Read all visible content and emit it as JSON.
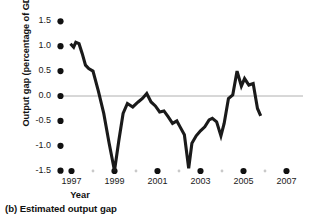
{
  "figure": {
    "caption": "(b) Estimated output gap",
    "background": "#ffffff"
  },
  "colors": {
    "line": "#1a1a1a",
    "zero_line": "#b0b0b0",
    "major_tick": "#111111",
    "minor_tick": "#c9c9c9",
    "text": "#111111"
  },
  "chart_data": {
    "type": "line",
    "title": "",
    "subtitle": "",
    "xlabel": "Year",
    "ylabel": "Output gap (percentage of GDP)",
    "xlim": [
      1996.3,
      2007.6
    ],
    "ylim": [
      -1.6,
      1.62
    ],
    "grid": false,
    "legend": false,
    "legend_position": "none",
    "zero_line": 0.0,
    "ytick_labels": [
      "1.5",
      "1.0",
      "0.5",
      "0.0",
      "-0.5",
      "-1.0",
      "-1.5"
    ],
    "ytick_values": [
      1.5,
      1.0,
      0.5,
      0.0,
      -0.5,
      -1.0,
      -1.5
    ],
    "xtick_labels": [
      "1997",
      "1999",
      "2001",
      "2003",
      "2005",
      "2007"
    ],
    "xtick_values": [
      1997,
      1999,
      2001,
      2003,
      2005,
      2007
    ],
    "xtick_minor_values": [
      1998,
      2000,
      2002,
      2004,
      2006
    ],
    "series": [
      {
        "name": "Estimated output gap",
        "x": [
          1996.95,
          1997.1,
          1997.2,
          1997.35,
          1997.5,
          1997.65,
          1997.8,
          1998.0,
          1998.25,
          1998.5,
          1998.75,
          1999.0,
          1999.2,
          1999.4,
          1999.6,
          1999.85,
          2000.1,
          2000.3,
          2000.5,
          2000.7,
          2000.9,
          2001.1,
          2001.3,
          2001.5,
          2001.7,
          2001.9,
          2002.05,
          2002.25,
          2002.45,
          2002.6,
          2002.8,
          2003.0,
          2003.2,
          2003.4,
          2003.55,
          2003.75,
          2003.95,
          2004.1,
          2004.3,
          2004.5,
          2004.7,
          2004.9,
          2005.05,
          2005.25,
          2005.45,
          2005.65,
          2005.8
        ],
        "y": [
          1.05,
          0.98,
          1.08,
          1.05,
          0.85,
          0.62,
          0.55,
          0.5,
          0.1,
          -0.35,
          -0.95,
          -1.5,
          -0.9,
          -0.35,
          -0.15,
          -0.22,
          -0.12,
          -0.05,
          0.05,
          -0.12,
          -0.2,
          -0.32,
          -0.3,
          -0.42,
          -0.55,
          -0.5,
          -0.62,
          -0.78,
          -1.45,
          -0.95,
          -0.8,
          -0.7,
          -0.62,
          -0.48,
          -0.45,
          -0.52,
          -0.8,
          -0.55,
          -0.05,
          0.02,
          0.5,
          0.2,
          0.35,
          0.22,
          0.25,
          -0.25,
          -0.4
        ]
      }
    ]
  }
}
